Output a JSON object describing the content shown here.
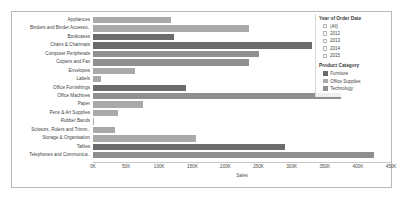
{
  "chart_data": {
    "type": "bar",
    "orientation": "horizontal",
    "title": "",
    "xlabel": "Sales",
    "ylabel": "",
    "xlim": [
      0,
      450000
    ],
    "xticks": [
      "0K",
      "50K",
      "100K",
      "150K",
      "200K",
      "250K",
      "300K",
      "350K",
      "400K",
      "450K"
    ],
    "xtick_values": [
      0,
      50000,
      100000,
      150000,
      200000,
      250000,
      300000,
      350000,
      400000,
      450000
    ],
    "grid": false,
    "legend_position": "right",
    "categories": [
      "Appliances",
      "Binders and Binder Accesso..",
      "Bookcases",
      "Chairs & Chairmats",
      "Computer Peripherals",
      "Copiers and Fax",
      "Envelopes",
      "Labels",
      "Office Furnishings",
      "Office Machines",
      "Paper",
      "Pens & Art Supplies",
      "Rubber Bands",
      "Scissors, Rulers and Trimm..",
      "Storage & Organisation",
      "Tables",
      "Telephones and Communica.."
    ],
    "values": [
      118000,
      235000,
      122000,
      330000,
      251000,
      235000,
      63000,
      12000,
      140000,
      375000,
      75000,
      37000,
      2000,
      33000,
      155000,
      290000,
      425000
    ],
    "bar_groups": [
      "Office Supplies",
      "Office Supplies",
      "Furniture",
      "Furniture",
      "Technology",
      "Technology",
      "Office Supplies",
      "Office Supplies",
      "Furniture",
      "Technology",
      "Office Supplies",
      "Office Supplies",
      "Office Supplies",
      "Office Supplies",
      "Office Supplies",
      "Furniture",
      "Technology"
    ],
    "series": [
      {
        "name": "Furniture",
        "color": "#6b6b6b"
      },
      {
        "name": "Office Supplies",
        "color": "#a9a9a9"
      },
      {
        "name": "Technology",
        "color": "#8f8f8f"
      }
    ]
  },
  "legend": {
    "year_filter": {
      "title": "Year of Order Date",
      "options": [
        "(All)",
        "2012",
        "2013",
        "2014",
        "2015"
      ]
    },
    "category_legend": {
      "title": "Product Category",
      "items": [
        {
          "label": "Furniture",
          "color": "#6b6b6b"
        },
        {
          "label": "Office Supplies",
          "color": "#a9a9a9"
        },
        {
          "label": "Technology",
          "color": "#8f8f8f"
        }
      ]
    }
  },
  "colors": {
    "furniture": "#6b6b6b",
    "office_supplies": "#a9a9a9",
    "technology": "#8f8f8f",
    "border": "#b9b9b9",
    "axis": "#c6c6c6"
  }
}
